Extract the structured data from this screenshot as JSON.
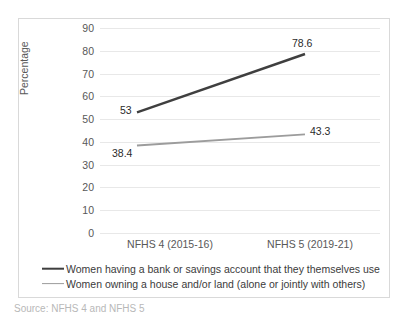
{
  "chart_data": {
    "type": "line",
    "title": "",
    "xlabel": "",
    "ylabel": "Percentage",
    "categories": [
      "NFHS 4 (2015-16)",
      "NFHS 5 (2019-21)"
    ],
    "yticks": [
      90,
      80,
      70,
      60,
      50,
      40,
      30,
      20,
      10,
      0
    ],
    "ylim": [
      0,
      90
    ],
    "grid": "horizontal",
    "legend_position": "bottom",
    "series": [
      {
        "name": "Women having a bank or savings account that they themselves use",
        "values": [
          53,
          78.6
        ],
        "labels": [
          "53",
          "78.6"
        ],
        "color": "#3f3f3f"
      },
      {
        "name": "Women owning a house and/or land (alone or jointly with others)",
        "values": [
          38.4,
          43.3
        ],
        "labels": [
          "38.4",
          "43.3"
        ],
        "color": "#9c9c9c"
      }
    ]
  },
  "bottom_caption": "Source: NFHS 4 and NFHS 5"
}
